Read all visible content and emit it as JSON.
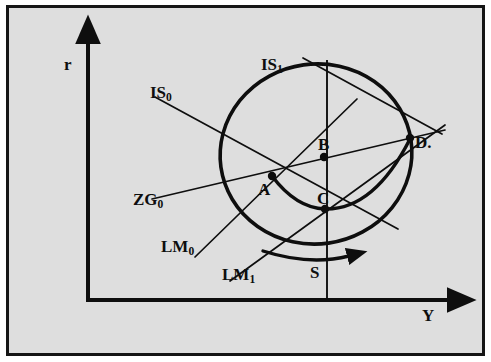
{
  "figure": {
    "kind": "is-lm-economic-diagram",
    "background_color": "#dedede",
    "frame_color": "#151515",
    "ink_color": "#0e0e0e",
    "width": 491,
    "height": 362
  },
  "axes": {
    "y_axis_label": "r",
    "x_axis_label": "Y",
    "origin": {
      "x": 88,
      "y": 300
    },
    "vertical_axis_top": {
      "x": 88,
      "y": 36
    },
    "horizontal_axis_right": {
      "x": 455,
      "y": 300
    }
  },
  "curve_labels": [
    {
      "id": "is0",
      "base": "IS",
      "sub": "0",
      "x": 150,
      "y": 86,
      "pointer_to": {
        "x": 272,
        "y": 176
      }
    },
    {
      "id": "is1",
      "base": "IS",
      "sub": "1",
      "x": 262,
      "y": 58,
      "pointer_to": {
        "x": 368,
        "y": 140
      }
    },
    {
      "id": "zg0",
      "base": "ZG",
      "sub": "0",
      "x": 137,
      "y": 196,
      "pointer_to": {
        "x": 272,
        "y": 176
      }
    },
    {
      "id": "lm0",
      "base": "LM",
      "sub": "0",
      "x": 163,
      "y": 241,
      "pointer_to": {
        "x": 272,
        "y": 176
      }
    },
    {
      "id": "lm1",
      "base": "LM",
      "sub": "1",
      "x": 224,
      "y": 270,
      "pointer_to": {
        "x": 325,
        "y": 208
      }
    }
  ],
  "point_labels": [
    {
      "id": "A",
      "text": "A",
      "x": 259,
      "y": 185,
      "dot": {
        "x": 272,
        "y": 176
      }
    },
    {
      "id": "B",
      "text": "B",
      "x": 318,
      "y": 142,
      "dot": {
        "x": 324,
        "y": 157
      }
    },
    {
      "id": "C",
      "text": "C",
      "x": 318,
      "y": 196,
      "dot": {
        "x": 325,
        "y": 208
      }
    },
    {
      "id": "D",
      "text": "D.",
      "x": 415,
      "y": 142,
      "dot": {
        "x": 410,
        "y": 138
      }
    }
  ],
  "annotations": [
    {
      "id": "s",
      "text": "S",
      "x": 318,
      "y": 268
    }
  ],
  "geometry": {
    "outer_ellipse": {
      "cx": 316,
      "cy": 154,
      "rx": 96,
      "ry": 90,
      "rotation_deg": -8,
      "stroke_width": 3.6
    },
    "inner_arc": {
      "from": "A",
      "through_low": "C",
      "to": "D",
      "stroke_width": 3.4
    },
    "motion_arrow": {
      "from": {
        "x": 265,
        "y": 253
      },
      "to": {
        "x": 353,
        "y": 258
      },
      "direction": "clockwise-right"
    },
    "vertical_line_s": {
      "x": 327,
      "y_top": 60,
      "y_bottom": 300
    },
    "straight_lines": [
      {
        "id": "is0-line",
        "from": {
          "x": 155,
          "y": 97
        },
        "to": {
          "x": 398,
          "y": 229
        }
      },
      {
        "id": "is1-line",
        "from": {
          "x": 303,
          "y": 58
        },
        "to": {
          "x": 440,
          "y": 133
        }
      },
      {
        "id": "zg0-line",
        "from": {
          "x": 152,
          "y": 199
        },
        "to": {
          "x": 443,
          "y": 131
        }
      },
      {
        "id": "lm0-line",
        "from": {
          "x": 195,
          "y": 257
        },
        "to": {
          "x": 355,
          "y": 100
        }
      },
      {
        "id": "lm1-line",
        "from": {
          "x": 230,
          "y": 281
        },
        "to": {
          "x": 443,
          "y": 126
        }
      }
    ]
  }
}
